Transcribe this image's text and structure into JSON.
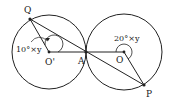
{
  "diagram": {
    "points": {
      "Q": "Q",
      "O_prime": "O'",
      "A": "A",
      "O": "O",
      "P": "P"
    },
    "angle_labels": {
      "left": "10°×y",
      "right": "20°×y"
    },
    "colors": {
      "stroke": "#222222",
      "background": "#ffffff"
    }
  }
}
